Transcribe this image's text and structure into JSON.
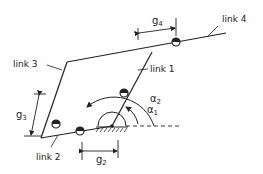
{
  "diagram": {
    "type": "linkage-mechanism",
    "labels": {
      "link1": "link 1",
      "link2": "link 2",
      "link3": "link 3",
      "link4": "link 4"
    },
    "dimensions": {
      "g2": {
        "base": "g",
        "sub": "2"
      },
      "g3": {
        "base": "g",
        "sub": "3"
      },
      "g4": {
        "base": "g",
        "sub": "4"
      }
    },
    "angles": {
      "a1": {
        "base": "α",
        "sub": "1"
      },
      "a2": {
        "base": "α",
        "sub": "2"
      }
    },
    "colors": {
      "ink": "#222222",
      "background": "#ffffff"
    }
  }
}
